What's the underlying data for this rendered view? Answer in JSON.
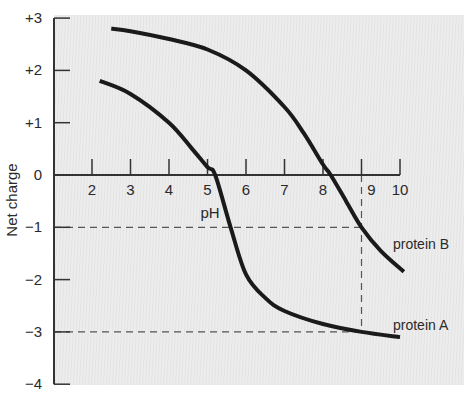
{
  "chart_data": {
    "type": "line",
    "title": "",
    "xlabel": "pH",
    "ylabel": "Net charge",
    "xlim": [
      1,
      10
    ],
    "ylim": [
      -4,
      3
    ],
    "x_ticks": [
      2,
      3,
      4,
      5,
      6,
      7,
      8,
      9,
      10
    ],
    "x_tick_labels": [
      "2",
      "3",
      "4",
      "5",
      "6",
      "7",
      "8",
      "9",
      "10"
    ],
    "y_ticks": [
      3,
      2,
      1,
      0,
      -1,
      -2,
      -3,
      -4
    ],
    "y_tick_labels": [
      "+3",
      "+2",
      "+1",
      "0",
      "−1",
      "−2",
      "−3",
      "−4"
    ],
    "grid": false,
    "legend": "inline labels at curve ends (right)",
    "series": [
      {
        "name": "protein A",
        "x": [
          2.2,
          3.0,
          4.0,
          4.6,
          5.0,
          5.2,
          5.6,
          6.0,
          6.5,
          7.0,
          8.0,
          9.0,
          10.0
        ],
        "y": [
          1.8,
          1.55,
          1.0,
          0.5,
          0.15,
          0.0,
          -1.0,
          -1.9,
          -2.35,
          -2.6,
          -2.85,
          -3.0,
          -3.1
        ]
      },
      {
        "name": "protein B",
        "x": [
          2.5,
          3.0,
          4.0,
          5.0,
          6.0,
          7.0,
          7.5,
          8.0,
          8.2,
          8.6,
          9.0,
          9.5,
          10.1
        ],
        "y": [
          2.8,
          2.75,
          2.6,
          2.4,
          2.0,
          1.3,
          0.8,
          0.2,
          0.0,
          -0.5,
          -1.0,
          -1.45,
          -1.85
        ]
      }
    ],
    "annotations": [
      {
        "type": "dashed-hline",
        "y": -1,
        "x_range": [
          1,
          9
        ],
        "note": "protein B net charge at pH 9"
      },
      {
        "type": "dashed-hline",
        "y": -3,
        "x_range": [
          1,
          9
        ],
        "note": "protein A net charge at pH 9"
      },
      {
        "type": "dashed-vline",
        "x": 9,
        "y_range": [
          -3,
          0
        ]
      }
    ],
    "colors": {
      "background": "#ededed",
      "curve": "#1a1a1a",
      "axis": "#333333",
      "dashed": "#555555"
    }
  }
}
